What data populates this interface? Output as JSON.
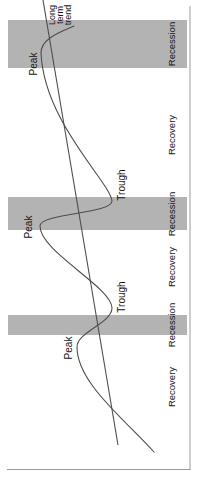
{
  "figure": {
    "type": "business-cycle-diagram",
    "orientation": "rotated-90deg-counterclockwise"
  },
  "labels": {
    "peak": "Peak",
    "trough": "Trough",
    "recession": "Recession",
    "recovery": "Recovery",
    "trend_line1": "Long",
    "trend_line2": "term",
    "trend_line3": "trend"
  },
  "colors": {
    "background": "#ffffff",
    "recession_band": "#b3b3b3",
    "axis": "#9b9b9b",
    "line": "#4d4d4d",
    "text": "#141414"
  },
  "geometry": {
    "canvas": {
      "width": 477,
      "height": 200
    },
    "y_axis": {
      "x": 7.5,
      "y1": 7,
      "y2": 190.5
    },
    "x_axis": {
      "y": 190,
      "x1": 7,
      "x2": 471
    },
    "band_y": 8,
    "band_height": 179,
    "recession_bands": [
      {
        "x": 142,
        "width": 20
      },
      {
        "x": 247,
        "width": 33
      },
      {
        "x": 409,
        "width": 48
      }
    ],
    "trend_line": {
      "x1": 32,
      "y1": 118,
      "x2": 477,
      "y2": 43
    },
    "cycle_path": "M25,154 C60,122 95,77 130,77 C145,77 154,112 169,112 C190,112 225,40 251,40 C264,40 263,112 276,112 C295,110 355,44 424,41 C438,41 444,58 451,74"
  }
}
